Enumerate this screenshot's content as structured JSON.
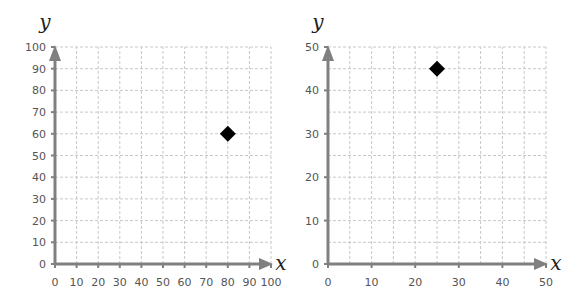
{
  "chart_data": [
    {
      "type": "scatter",
      "title": "",
      "xlabel": "x",
      "ylabel": "y",
      "xlim": [
        0,
        100
      ],
      "ylim": [
        0,
        100
      ],
      "x_ticks": [
        0,
        10,
        20,
        30,
        40,
        50,
        60,
        70,
        80,
        90,
        100
      ],
      "y_ticks": [
        0,
        10,
        20,
        30,
        40,
        50,
        60,
        70,
        80,
        90,
        100
      ],
      "grid_step": 10,
      "grid": true,
      "marker": "diamond",
      "points": [
        {
          "x": 80,
          "y": 60
        }
      ]
    },
    {
      "type": "scatter",
      "title": "",
      "xlabel": "x",
      "ylabel": "y",
      "xlim": [
        0,
        50
      ],
      "ylim": [
        0,
        50
      ],
      "x_ticks": [
        0,
        10,
        20,
        30,
        40,
        50
      ],
      "y_ticks": [
        0,
        10,
        20,
        30,
        40,
        50
      ],
      "grid_step": 5,
      "grid": true,
      "marker": "diamond",
      "points": [
        {
          "x": 25,
          "y": 45
        }
      ]
    }
  ],
  "layout": [
    {
      "x0": 55,
      "x1": 271,
      "y0": 264,
      "y1": 47
    },
    {
      "x0": 328,
      "x1": 546,
      "y0": 264,
      "y1": 47
    }
  ],
  "colors": {
    "axis": "#808080",
    "grid": "#c8c8c8",
    "marker": "#000000"
  }
}
